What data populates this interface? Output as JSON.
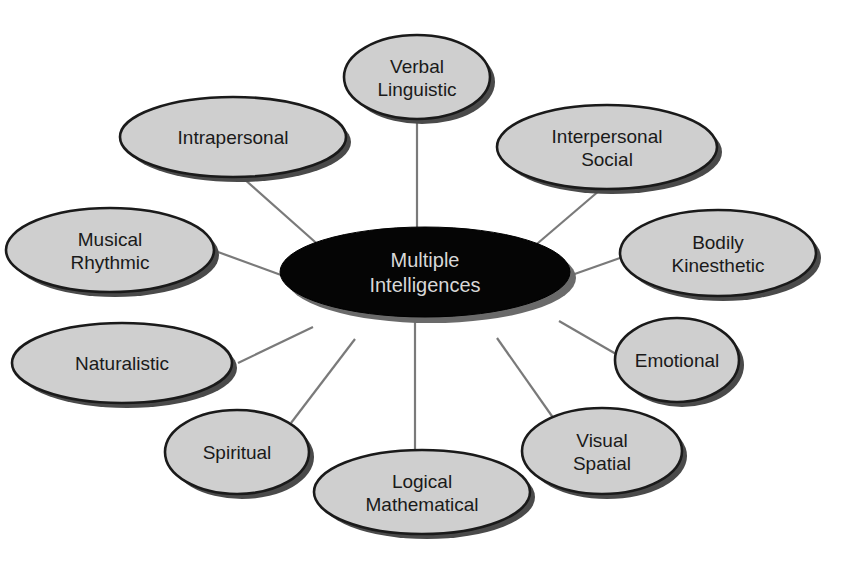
{
  "diagram": {
    "type": "mind-map",
    "colors": {
      "background": "#ffffff",
      "node_fill": "#cfcfcf",
      "node_stroke": "#1a1a1a",
      "center_fill": "#050505",
      "center_text": "#d8d8d8",
      "connector": "#7a7a7a"
    },
    "center": {
      "lines": [
        "Multiple",
        "Intelligences"
      ],
      "cx": 425,
      "cy": 272,
      "rx": 145,
      "ry": 45
    },
    "nodes": [
      {
        "id": "verbal-linguistic",
        "lines": [
          "Verbal",
          "Linguistic"
        ],
        "cx": 417,
        "cy": 77,
        "rx": 73,
        "ry": 42,
        "lx1": 417,
        "ly1": 119,
        "lx2": 417,
        "ly2": 227
      },
      {
        "id": "intrapersonal",
        "lines": [
          "Intrapersonal"
        ],
        "cx": 233,
        "cy": 137,
        "rx": 113,
        "ry": 40,
        "lx1": 243,
        "ly1": 178,
        "lx2": 323,
        "ly2": 249
      },
      {
        "id": "interpersonal-social",
        "lines": [
          "Interpersonal",
          "Social"
        ],
        "cx": 607,
        "cy": 147,
        "rx": 110,
        "ry": 42,
        "lx1": 600,
        "ly1": 190,
        "lx2": 531,
        "ly2": 249
      },
      {
        "id": "musical-rhythmic",
        "lines": [
          "Musical",
          "Rhythmic"
        ],
        "cx": 110,
        "cy": 250,
        "rx": 104,
        "ry": 42,
        "lx1": 218,
        "ly1": 252,
        "lx2": 281,
        "ly2": 275
      },
      {
        "id": "bodily-kinesthetic",
        "lines": [
          "Bodily",
          "Kinesthetic"
        ],
        "cx": 718,
        "cy": 253,
        "rx": 98,
        "ry": 43,
        "lx1": 620,
        "ly1": 258,
        "lx2": 569,
        "ly2": 276
      },
      {
        "id": "naturalistic",
        "lines": [
          "Naturalistic"
        ],
        "cx": 122,
        "cy": 363,
        "rx": 110,
        "ry": 40,
        "lx1": 238,
        "ly1": 363,
        "lx2": 313,
        "ly2": 327
      },
      {
        "id": "emotional",
        "lines": [
          "Emotional"
        ],
        "cx": 677,
        "cy": 360,
        "rx": 62,
        "ry": 42,
        "lx1": 616,
        "ly1": 354,
        "lx2": 559,
        "ly2": 321
      },
      {
        "id": "spiritual",
        "lines": [
          "Spiritual"
        ],
        "cx": 237,
        "cy": 452,
        "rx": 72,
        "ry": 42,
        "lx1": 291,
        "ly1": 423,
        "lx2": 355,
        "ly2": 339
      },
      {
        "id": "visual-spatial",
        "lines": [
          "Visual",
          "Spatial"
        ],
        "cx": 602,
        "cy": 451,
        "rx": 80,
        "ry": 43,
        "lx1": 554,
        "ly1": 419,
        "lx2": 497,
        "ly2": 338
      },
      {
        "id": "logical-mathematical",
        "lines": [
          "Logical",
          "Mathematical"
        ],
        "cx": 422,
        "cy": 492,
        "rx": 108,
        "ry": 42,
        "lx1": 415,
        "ly1": 450,
        "lx2": 415,
        "ly2": 317
      }
    ]
  }
}
